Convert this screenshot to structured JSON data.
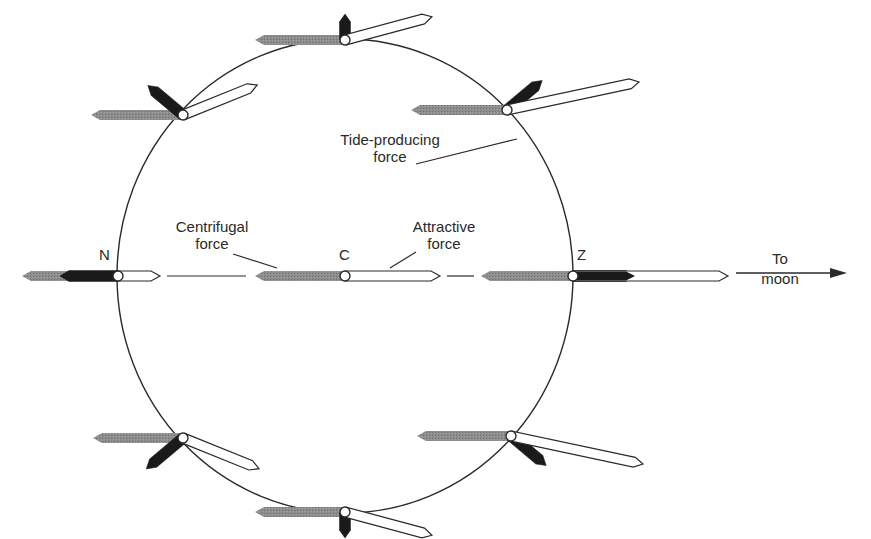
{
  "diagram": {
    "type": "tide-producing forces on earth",
    "colors": {
      "centrifugal": "#8a8a8a",
      "attractive_fill": "#ffffff",
      "tide_producing": "#1a1a1a",
      "outline": "#2a2a2a",
      "background": "#ffffff"
    },
    "circle": {
      "cx": 345,
      "cy": 276,
      "rx": 228,
      "ry": 237
    },
    "points": {
      "N": {
        "label": "N",
        "x": 118,
        "y": 276
      },
      "C": {
        "label": "C",
        "x": 345,
        "y": 276
      },
      "Z": {
        "label": "Z",
        "x": 573,
        "y": 276
      }
    },
    "labels": {
      "centrifugal_line1": "Centrifugal",
      "centrifugal_line2": "force",
      "attractive_line1": "Attractive",
      "attractive_line2": "force",
      "tide_line1": "Tide-producing",
      "tide_line2": "force",
      "moon_line1": "To",
      "moon_line2": "moon"
    },
    "vectors": [
      {
        "id": "top",
        "x": 345,
        "y": 40,
        "centrifugal_len": 90,
        "attractive_angle": 15,
        "attractive_len": 90,
        "tide_angle": 90,
        "tide_len": 26
      },
      {
        "id": "upper-left",
        "x": 183,
        "y": 115,
        "centrifugal_len": 92,
        "attractive_angle": 22,
        "attractive_len": 80,
        "tide_angle": 140,
        "tide_len": 46
      },
      {
        "id": "upper-right",
        "x": 507,
        "y": 110,
        "centrifugal_len": 96,
        "attractive_angle": 12,
        "attractive_len": 135,
        "tide_angle": 40,
        "tide_len": 46
      },
      {
        "id": "N",
        "x": 118,
        "y": 276,
        "centrifugal_len": 96,
        "attractive_angle": 0,
        "attractive_len": 42,
        "tide_angle": 180,
        "tide_len": 58
      },
      {
        "id": "C",
        "x": 345,
        "y": 276,
        "centrifugal_len": 90,
        "attractive_angle": 0,
        "attractive_len": 95,
        "tide_angle": null,
        "tide_len": 0
      },
      {
        "id": "Z",
        "x": 573,
        "y": 276,
        "centrifugal_len": 92,
        "attractive_angle": 0,
        "attractive_len": 155,
        "tide_angle": 0,
        "tide_len": 62
      },
      {
        "id": "lower-left",
        "x": 183,
        "y": 438,
        "centrifugal_len": 90,
        "attractive_angle": -22,
        "attractive_len": 82,
        "tide_angle": -140,
        "tide_len": 48
      },
      {
        "id": "lower-right",
        "x": 511,
        "y": 436,
        "centrifugal_len": 94,
        "attractive_angle": -12,
        "attractive_len": 135,
        "tide_angle": -40,
        "tide_len": 46
      },
      {
        "id": "bottom",
        "x": 345,
        "y": 512,
        "centrifugal_len": 90,
        "attractive_angle": -15,
        "attractive_len": 90,
        "tide_angle": -90,
        "tide_len": 26
      }
    ]
  }
}
